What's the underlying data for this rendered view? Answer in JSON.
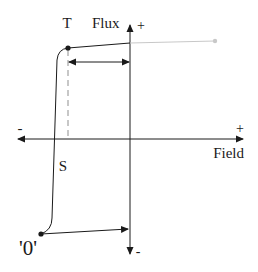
{
  "diagram": {
    "type": "hysteresis-loop",
    "labels": {
      "vertical_axis": "Flux",
      "horizontal_axis": "Field",
      "vertical_plus": "+",
      "vertical_minus": "-",
      "horizontal_plus": "+",
      "horizontal_minus": "-",
      "point_top": "T",
      "point_switch": "S",
      "point_zero": "'0'"
    },
    "colors": {
      "line": "#1a1a1a",
      "extension": "#c8c8c8",
      "dashed": "#9a9a9a",
      "background": "#ffffff"
    }
  }
}
